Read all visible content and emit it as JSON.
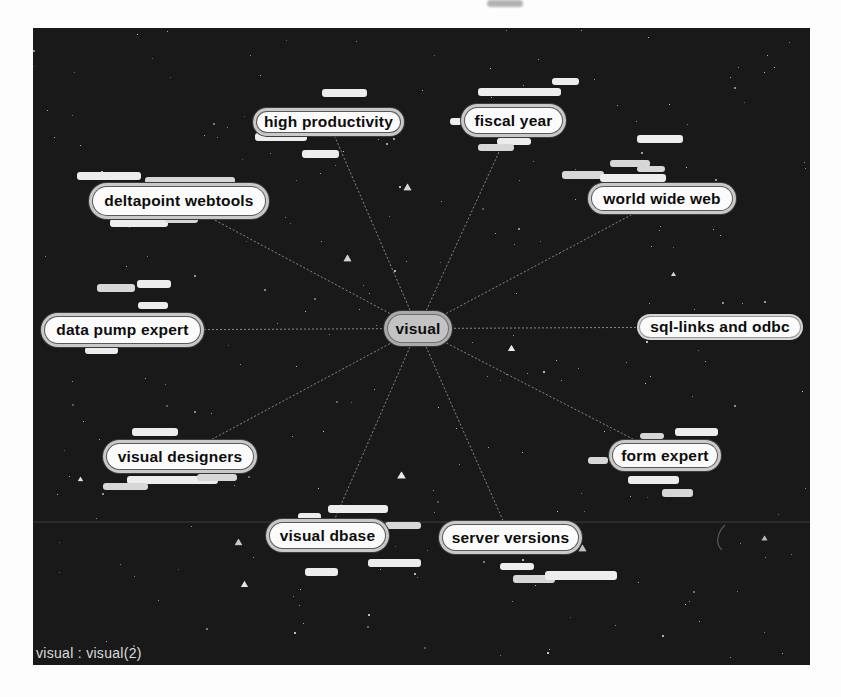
{
  "window": {
    "status_text": "visual : visual(2)"
  },
  "colors": {
    "canvas_bg": "#191919",
    "node_fill": "#fbfbfb",
    "node_ring": "#c9c9c9",
    "node_edge": "#3c3c3c",
    "center_fill": "#c3c3c3",
    "link_line": "#9d9d9d",
    "smear_light": "#d7d7d7",
    "smear_bright": "#ededed",
    "star": "#ffffff",
    "status": "#dcdcdc"
  },
  "diagram": {
    "center_node": {
      "label": "visual",
      "x": 350,
      "y": 282,
      "w": 70,
      "h": 37
    },
    "nodes": [
      {
        "label": "high productivity",
        "x": 219,
        "y": 79,
        "w": 153,
        "h": 30
      },
      {
        "label": "fiscal year",
        "x": 427,
        "y": 75,
        "w": 107,
        "h": 35
      },
      {
        "label": "world wide web",
        "x": 554,
        "y": 154,
        "w": 150,
        "h": 33
      },
      {
        "label": "deltapoint webtools",
        "x": 55,
        "y": 154,
        "w": 182,
        "h": 38
      },
      {
        "label": "data pump expert",
        "x": 7,
        "y": 284,
        "w": 165,
        "h": 36
      },
      {
        "label": "sql-links and odbc",
        "x": 602,
        "y": 284,
        "w": 170,
        "h": 30,
        "flat": true
      },
      {
        "label": "visual designers",
        "x": 69,
        "y": 411,
        "w": 156,
        "h": 35
      },
      {
        "label": "visual dbase",
        "x": 232,
        "y": 490,
        "w": 125,
        "h": 35
      },
      {
        "label": "server versions",
        "x": 405,
        "y": 492,
        "w": 145,
        "h": 35
      },
      {
        "label": "form expert",
        "x": 575,
        "y": 411,
        "w": 114,
        "h": 33
      }
    ],
    "smears": [
      [
        289,
        61,
        45,
        8,
        1
      ],
      [
        222,
        105,
        52,
        8,
        1
      ],
      [
        269,
        122,
        37,
        8,
        1
      ],
      [
        44,
        144,
        64,
        8,
        1
      ],
      [
        112,
        149,
        90,
        7,
        0
      ],
      [
        77,
        191,
        58,
        8,
        1
      ],
      [
        132,
        188,
        33,
        7,
        0
      ],
      [
        519,
        50,
        27,
        7,
        1
      ],
      [
        445,
        60,
        83,
        8,
        1
      ],
      [
        417,
        90,
        12,
        7,
        1
      ],
      [
        464,
        110,
        34,
        7,
        1
      ],
      [
        445,
        116,
        36,
        7,
        0
      ],
      [
        604,
        107,
        46,
        8,
        1
      ],
      [
        577,
        132,
        40,
        7,
        0
      ],
      [
        604,
        138,
        28,
        6,
        0
      ],
      [
        529,
        143,
        42,
        8,
        0
      ],
      [
        567,
        146,
        66,
        8,
        1
      ],
      [
        64,
        256,
        38,
        8,
        0
      ],
      [
        104,
        252,
        34,
        8,
        1
      ],
      [
        105,
        274,
        30,
        7,
        1
      ],
      [
        52,
        319,
        33,
        7,
        1
      ],
      [
        99,
        400,
        46,
        8,
        1
      ],
      [
        94,
        448,
        91,
        8,
        1
      ],
      [
        70,
        455,
        45,
        7,
        0
      ],
      [
        164,
        446,
        40,
        7,
        0
      ],
      [
        265,
        485,
        23,
        7,
        1
      ],
      [
        295,
        477,
        60,
        8,
        1
      ],
      [
        352,
        494,
        36,
        7,
        0
      ],
      [
        335,
        531,
        53,
        8,
        1
      ],
      [
        272,
        540,
        33,
        8,
        1
      ],
      [
        467,
        535,
        34,
        7,
        1
      ],
      [
        480,
        547,
        42,
        8,
        0
      ],
      [
        512,
        543,
        72,
        9,
        1
      ],
      [
        607,
        405,
        24,
        6,
        0
      ],
      [
        642,
        400,
        43,
        8,
        1
      ],
      [
        555,
        429,
        20,
        7,
        0
      ],
      [
        595,
        448,
        51,
        8,
        1
      ],
      [
        629,
        461,
        31,
        8,
        0
      ]
    ],
    "scanline_y": 494,
    "stars": {
      "dot_count": 235,
      "triangle_count": 10,
      "seed": 42
    }
  }
}
